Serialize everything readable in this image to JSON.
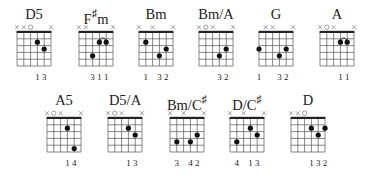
{
  "chords": [
    {
      "name": "D5",
      "sharp": false,
      "markers": [
        "x",
        "x",
        "o",
        "",
        "",
        "x"
      ],
      "dots": [
        [
          3,
          2
        ],
        [
          4,
          3
        ]
      ],
      "barre": null,
      "fingers": [
        "",
        "",
        "",
        "1",
        "3",
        ""
      ],
      "pos": [
        9,
        14
      ]
    },
    {
      "name": "F",
      "sharp": true,
      "suffix": "m",
      "markers": [
        "x",
        "x",
        "",
        "",
        "",
        "x"
      ],
      "dots": [
        [
          2,
          4
        ],
        [
          3,
          2
        ],
        [
          4,
          2
        ]
      ],
      "barre": [
        3,
        4,
        2
      ],
      "fingers": [
        "",
        "",
        "3",
        "1",
        "1",
        ""
      ],
      "pos": [
        71,
        14
      ]
    },
    {
      "name": "Bm",
      "sharp": false,
      "markers": [
        "x",
        "",
        "x",
        "",
        "",
        "x"
      ],
      "dots": [
        [
          1,
          2
        ],
        [
          3,
          4
        ],
        [
          4,
          3
        ]
      ],
      "barre": null,
      "fingers": [
        "",
        "1",
        "",
        "3",
        "2",
        ""
      ],
      "pos": [
        131,
        14
      ]
    },
    {
      "name": "Bm/A",
      "sharp": false,
      "markers": [
        "x",
        "o",
        "x",
        "",
        "",
        "x"
      ],
      "dots": [
        [
          3,
          4
        ],
        [
          4,
          3
        ]
      ],
      "barre": null,
      "fingers": [
        "",
        "",
        "",
        "3",
        "2",
        ""
      ],
      "pos": [
        191,
        14
      ]
    },
    {
      "name": "G",
      "sharp": false,
      "markers": [
        "",
        "x",
        "x",
        "",
        "",
        "x"
      ],
      "dots": [
        [
          0,
          3
        ],
        [
          3,
          4
        ],
        [
          4,
          3
        ]
      ],
      "barre": null,
      "fingers": [
        "1",
        "",
        "",
        "3",
        "2",
        ""
      ],
      "pos": [
        251,
        14
      ]
    },
    {
      "name": "A",
      "sharp": false,
      "markers": [
        "x",
        "o",
        "x",
        "",
        "",
        "x"
      ],
      "dots": [
        [
          3,
          2
        ],
        [
          4,
          2
        ]
      ],
      "barre": [
        3,
        4,
        2
      ],
      "fingers": [
        "",
        "",
        "",
        "1",
        "1",
        ""
      ],
      "pos": [
        312,
        14
      ]
    },
    {
      "name": "A5",
      "sharp": false,
      "markers": [
        "x",
        "o",
        "x",
        "",
        "",
        "x"
      ],
      "dots": [
        [
          3,
          2
        ],
        [
          4,
          5
        ]
      ],
      "barre": null,
      "fingers": [
        "",
        "",
        "",
        "1",
        "4",
        ""
      ],
      "pos": [
        39,
        100
      ]
    },
    {
      "name": "D5/A",
      "sharp": false,
      "markers": [
        "x",
        "o",
        "x",
        "",
        "",
        "x"
      ],
      "dots": [
        [
          3,
          2
        ],
        [
          4,
          3
        ]
      ],
      "barre": null,
      "fingers": [
        "",
        "",
        "",
        "1",
        "3",
        ""
      ],
      "pos": [
        100,
        100
      ]
    },
    {
      "name": "Bm/C",
      "sharp": true,
      "suffix": "",
      "markers": [
        "x",
        "",
        "x",
        "",
        "",
        "x"
      ],
      "dots": [
        [
          1,
          4
        ],
        [
          3,
          4
        ],
        [
          4,
          3
        ]
      ],
      "barre": null,
      "fingers": [
        "",
        "3",
        "",
        "4",
        "2",
        ""
      ],
      "pos": [
        162,
        100
      ]
    },
    {
      "name": "D/C",
      "sharp": true,
      "suffix": "",
      "markers": [
        "x",
        "",
        "x",
        "",
        "",
        "x"
      ],
      "dots": [
        [
          1,
          4
        ],
        [
          3,
          2
        ],
        [
          4,
          3
        ]
      ],
      "barre": null,
      "fingers": [
        "",
        "4",
        "",
        "1",
        "3",
        ""
      ],
      "pos": [
        222,
        100
      ]
    },
    {
      "name": "D",
      "sharp": false,
      "markers": [
        "x",
        "x",
        "o",
        "",
        "",
        ""
      ],
      "dots": [
        [
          3,
          2
        ],
        [
          4,
          3
        ],
        [
          5,
          2
        ]
      ],
      "barre": null,
      "fingers": [
        "",
        "",
        "",
        "1",
        "3",
        "2"
      ],
      "pos": [
        283,
        100
      ]
    }
  ],
  "labels": {
    "c0": "D5",
    "c1": "F",
    "c1s": "♯",
    "c1x": "m",
    "c2": "Bm",
    "c3": "Bm/A",
    "c4": "G",
    "c5": "A",
    "c6": "A5",
    "c7": "D5/A",
    "c8": "Bm/C",
    "c8s": "♯",
    "c9": "D/C",
    "c9s": "♯",
    "c10": "D"
  },
  "style": {
    "line_color": "#555555",
    "nut_color": "#222222",
    "dot_color": "#111111",
    "marker_color": "#777777"
  }
}
